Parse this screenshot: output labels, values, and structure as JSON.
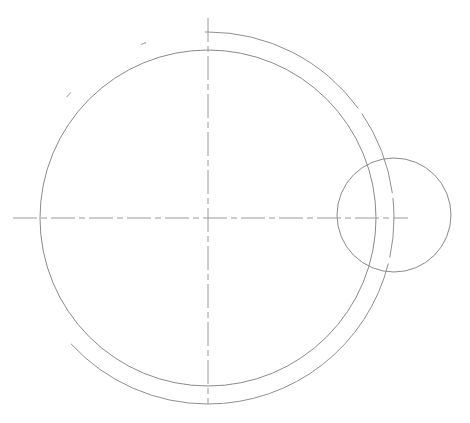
{
  "document": {
    "title": "Mechanical Part Outline — Circular Profile with Boss",
    "type": "engineering-line-drawing",
    "canvas": {
      "width": 470,
      "height": 423,
      "background": "#ffffff"
    }
  },
  "style": {
    "line_color": "#8a8a8e",
    "outer_line_color": "#8f8f94",
    "centerline_color": "#9a9a9f",
    "line_width": 1,
    "centerline_dash": "24 4 6 4",
    "outer_arc_gap_dash": "270 6 86 5 60 6 400"
  },
  "geometry": {
    "main_center": {
      "x": 208,
      "y": 218
    },
    "outer_circle": {
      "cx": 208,
      "cy": 218,
      "r": 186,
      "name": "outer-circle"
    },
    "inner_circle": {
      "cx": 208,
      "cy": 218,
      "r": 168,
      "name": "inner-circle"
    },
    "small_circle": {
      "cx": 394,
      "cy": 215,
      "r": 57,
      "name": "small-circle"
    },
    "horizontal_centerline": {
      "x1": 13,
      "y1": 218,
      "x2": 408,
      "y2": 218
    },
    "vertical_centerline": {
      "x1": 208,
      "y1": 18,
      "x2": 208,
      "y2": 404
    }
  },
  "chart_data": {
    "type": "scatter",
    "xlabel": "",
    "ylabel": "",
    "xlim": [
      0,
      470
    ],
    "ylim": [
      0,
      423
    ],
    "grid": false,
    "legend": "none",
    "series": [
      {
        "name": "outer-circle",
        "shape": "circle",
        "cx": 208,
        "cy": 218,
        "r": 186,
        "dashed_gaps": true
      },
      {
        "name": "inner-circle",
        "shape": "circle",
        "cx": 208,
        "cy": 218,
        "r": 168,
        "dashed_gaps": false
      },
      {
        "name": "small-circle",
        "shape": "circle",
        "cx": 394,
        "cy": 215,
        "r": 57,
        "dashed_gaps": false
      },
      {
        "name": "horizontal-centerline",
        "shape": "line",
        "x": [
          13,
          408
        ],
        "y": [
          218,
          218
        ],
        "linestyle": "dashdot"
      },
      {
        "name": "vertical-centerline",
        "shape": "line",
        "x": [
          208,
          208
        ],
        "y": [
          18,
          404
        ],
        "linestyle": "dashdot"
      }
    ]
  }
}
